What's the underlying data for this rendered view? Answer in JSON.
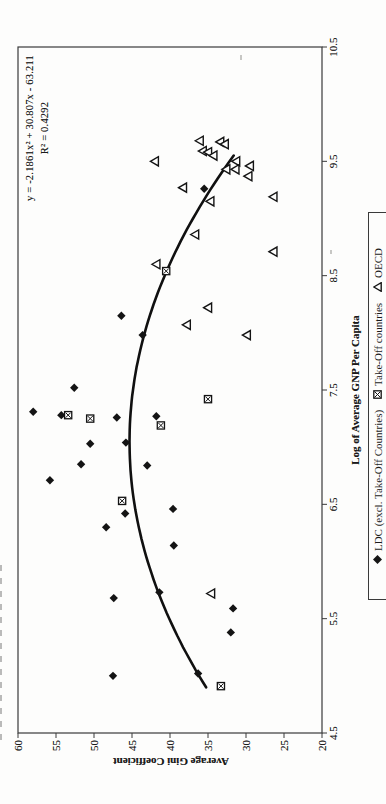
{
  "chart_data": {
    "type": "scatter",
    "xlabel": "Log of Average GNP Per Capita",
    "ylabel": "Average Gini Coefficient",
    "xlim": [
      4.5,
      10.5
    ],
    "ylim": [
      20,
      60
    ],
    "x_ticks": [
      "4.5",
      "5.5",
      "6.5",
      "7.5",
      "8.5",
      "9.5",
      "10.5"
    ],
    "y_ticks": [
      "20",
      "25",
      "30",
      "35",
      "40",
      "45",
      "50",
      "55",
      "60"
    ],
    "grid": false,
    "legend_position": "bottom-center-boxed",
    "page_orientation": "landscape chart rotated 90deg counter-clockwise on portrait page",
    "trendline": {
      "type": "quadratic",
      "a": -2.1861,
      "b": 30.807,
      "c": -63.211,
      "r2": 0.4292,
      "x_start": 4.9,
      "x_end": 9.55,
      "equation_label": "y = -2.1861x² + 30.807x - 63.211",
      "r2_label": "R² = 0.4292"
    },
    "series": [
      {
        "name": "LDC (excl. Take-Off Countries)",
        "marker": "diamond-filled",
        "points": [
          [
            8.15,
            46.4
          ],
          [
            7.98,
            43.6
          ],
          [
            7.52,
            52.6
          ],
          [
            7.31,
            58.0
          ],
          [
            7.28,
            54.3
          ],
          [
            7.26,
            47.0
          ],
          [
            7.27,
            41.8
          ],
          [
            7.03,
            50.5
          ],
          [
            7.04,
            45.8
          ],
          [
            6.85,
            51.7
          ],
          [
            6.84,
            43.0
          ],
          [
            6.71,
            55.8
          ],
          [
            6.46,
            39.6
          ],
          [
            6.42,
            45.9
          ],
          [
            6.3,
            48.4
          ],
          [
            6.14,
            39.5
          ],
          [
            5.73,
            41.4
          ],
          [
            5.68,
            47.4
          ],
          [
            5.59,
            31.7
          ],
          [
            5.38,
            32.0
          ],
          [
            5.02,
            36.3
          ],
          [
            5.0,
            47.5
          ],
          [
            9.26,
            35.5
          ]
        ]
      },
      {
        "name": "Take-Off countries",
        "marker": "square-x",
        "points": [
          [
            8.54,
            40.5
          ],
          [
            7.42,
            35.0
          ],
          [
            7.28,
            53.4
          ],
          [
            7.25,
            50.5
          ],
          [
            7.19,
            41.2
          ],
          [
            6.53,
            46.3
          ],
          [
            4.91,
            33.3
          ]
        ]
      },
      {
        "name": "OECD",
        "marker": "triangle-open",
        "points": [
          [
            9.68,
            36.1
          ],
          [
            9.59,
            35.7
          ],
          [
            9.58,
            35.0
          ],
          [
            9.55,
            34.3
          ],
          [
            9.67,
            33.4
          ],
          [
            9.65,
            32.8
          ],
          [
            9.5,
            31.3
          ],
          [
            9.43,
            32.6
          ],
          [
            9.43,
            31.4
          ],
          [
            9.46,
            29.5
          ],
          [
            9.37,
            29.7
          ],
          [
            9.5,
            42.0
          ],
          [
            9.27,
            38.3
          ],
          [
            9.15,
            34.7
          ],
          [
            9.19,
            26.4
          ],
          [
            8.86,
            36.7
          ],
          [
            8.71,
            26.4
          ],
          [
            8.6,
            41.8
          ],
          [
            8.22,
            35.0
          ],
          [
            8.07,
            37.8
          ],
          [
            7.98,
            29.9
          ],
          [
            5.72,
            34.6
          ]
        ]
      }
    ]
  }
}
